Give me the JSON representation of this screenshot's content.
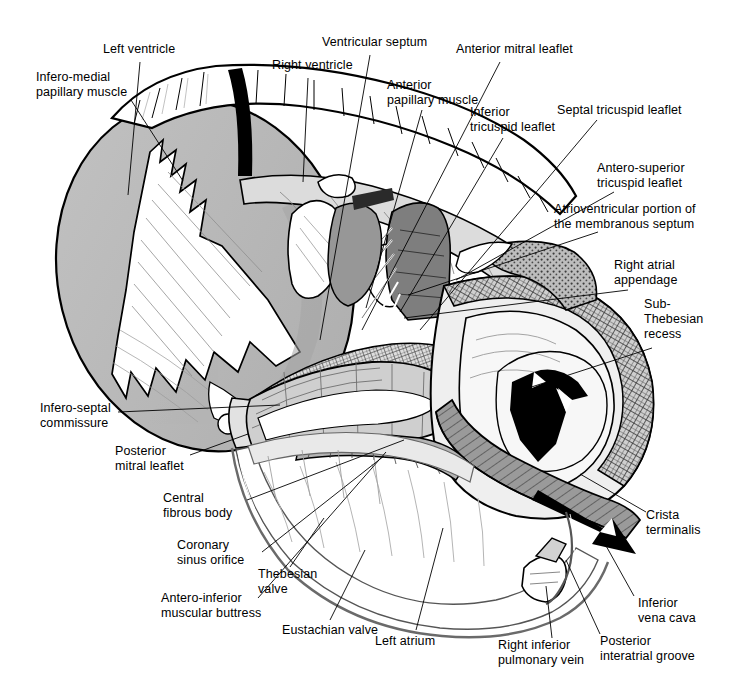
{
  "figure": {
    "width": 731,
    "height": 698,
    "background": "#ffffff",
    "line_color": "#000000",
    "fills": {
      "light_gray": "#d9d9d9",
      "mid_gray": "#b8b8b8",
      "dark_gray": "#8c8c8c",
      "darker_gray": "#6e6e6e",
      "black": "#000000",
      "white": "#ffffff"
    }
  },
  "labels": [
    {
      "id": "left-ventricle",
      "text": "Left ventricle",
      "x": 103,
      "y": 42,
      "align": "left",
      "leader": [
        [
          140,
          62
        ],
        [
          128,
          195
        ]
      ]
    },
    {
      "id": "infero-medial-papillary-muscle",
      "text": "Infero-medial\npapillary muscle",
      "x": 36,
      "y": 70,
      "align": "left",
      "leader": [
        [
          131,
          100
        ],
        [
          183,
          181
        ]
      ]
    },
    {
      "id": "right-ventricle",
      "text": "Right ventricle",
      "x": 272,
      "y": 58,
      "align": "left",
      "leader": [
        [
          308,
          78
        ],
        [
          303,
          182
        ]
      ]
    },
    {
      "id": "ventricular-septum",
      "text": "Ventricular septum",
      "x": 322,
      "y": 35,
      "align": "left",
      "leader": [
        [
          370,
          55
        ],
        [
          320,
          340
        ]
      ]
    },
    {
      "id": "anterior-papillary-muscle",
      "text": "Anterior\npapillary muscle",
      "x": 387,
      "y": 78,
      "align": "left",
      "leader": [
        [
          422,
          110
        ],
        [
          366,
          308
        ]
      ]
    },
    {
      "id": "anterior-mitral-leaflet",
      "text": "Anterior mitral leaflet",
      "x": 456,
      "y": 42,
      "align": "left",
      "leader": [
        [
          500,
          62
        ],
        [
          362,
          330
        ]
      ]
    },
    {
      "id": "inferior-tricuspid-leaflet",
      "text": "Inferior\ntricuspid leaflet",
      "x": 470,
      "y": 105,
      "align": "left",
      "leader": [
        [
          503,
          138
        ],
        [
          400,
          312
        ]
      ]
    },
    {
      "id": "septal-tricuspid-leaflet",
      "text": "Septal tricuspid leaflet",
      "x": 557,
      "y": 103,
      "align": "left",
      "leader": [
        [
          597,
          120
        ],
        [
          420,
          330
        ]
      ]
    },
    {
      "id": "antero-superior-tricuspid-leaflet",
      "text": "Antero-superior\ntricuspid leaflet",
      "x": 597,
      "y": 161,
      "align": "left",
      "leader": [
        [
          614,
          192
        ],
        [
          456,
          280
        ]
      ]
    },
    {
      "id": "atrioventricular-portion-membranous-septum",
      "text": "Atrioventricular portion of\nthe membranous septum",
      "x": 554,
      "y": 202,
      "align": "left",
      "leader": [
        [
          598,
          232
        ],
        [
          408,
          295
        ]
      ]
    },
    {
      "id": "right-atrial-appendage",
      "text": "Right atrial\nappendage",
      "x": 614,
      "y": 258,
      "align": "left",
      "leader": [
        [
          628,
          290
        ],
        [
          404,
          318
        ]
      ]
    },
    {
      "id": "sub-thebesian-recess",
      "text": "Sub-\nThebesian\nrecess",
      "x": 644,
      "y": 297,
      "align": "left",
      "leader": [
        [
          652,
          348
        ],
        [
          516,
          392
        ]
      ]
    },
    {
      "id": "crista-terminalis",
      "text": "Crista\nterminalis",
      "x": 646,
      "y": 508,
      "align": "left",
      "leader": [
        [
          646,
          512
        ],
        [
          580,
          474
        ]
      ]
    },
    {
      "id": "inferior-vena-cava",
      "text": "Inferior\nvena cava",
      "x": 638,
      "y": 596,
      "align": "left",
      "leader": [
        [
          634,
          596
        ],
        [
          600,
          535
        ]
      ]
    },
    {
      "id": "posterior-interatrial-groove",
      "text": "Posterior\ninteratrial groove",
      "x": 600,
      "y": 634,
      "align": "left",
      "leader": [
        [
          600,
          634
        ],
        [
          566,
          560
        ]
      ]
    },
    {
      "id": "right-inferior-pulmonary-vein",
      "text": "Right inferior\npulmonary vein",
      "x": 498,
      "y": 638,
      "align": "left",
      "leader": [
        [
          552,
          638
        ],
        [
          546,
          586
        ]
      ]
    },
    {
      "id": "left-atrium",
      "text": "Left atrium",
      "x": 375,
      "y": 634,
      "align": "left",
      "leader": [
        [
          416,
          630
        ],
        [
          443,
          528
        ]
      ]
    },
    {
      "id": "eustachian-valve",
      "text": "Eustachian valve",
      "x": 282,
      "y": 623,
      "align": "left",
      "leader": [
        [
          330,
          620
        ],
        [
          365,
          550
        ]
      ]
    },
    {
      "id": "thebesian-valve",
      "text": "Thebesian\nvalve",
      "x": 258,
      "y": 567,
      "align": "left",
      "leader": [
        [
          290,
          567
        ],
        [
          324,
          518
        ]
      ]
    },
    {
      "id": "antero-inferior-muscular-buttress",
      "text": "Antero-inferior\nmuscular buttress",
      "x": 161,
      "y": 591,
      "align": "left",
      "leader": [
        [
          258,
          598
        ],
        [
          386,
          452
        ]
      ]
    },
    {
      "id": "coronary-sinus-orifice",
      "text": "Coronary\nsinus orifice",
      "x": 177,
      "y": 538,
      "align": "left",
      "leader": [
        [
          262,
          552
        ],
        [
          384,
          456
        ]
      ]
    },
    {
      "id": "central-fibrous-body",
      "text": "Central\nfibrous body",
      "x": 163,
      "y": 491,
      "align": "left",
      "leader": [
        [
          247,
          500
        ],
        [
          404,
          440
        ]
      ]
    },
    {
      "id": "posterior-mitral-leaflet",
      "text": "Posterior\nmitral leaflet",
      "x": 115,
      "y": 444,
      "align": "left",
      "leader": [
        [
          190,
          455
        ],
        [
          248,
          434
        ]
      ]
    },
    {
      "id": "infero-septal-commissure",
      "text": "Infero-septal\ncommissure",
      "x": 40,
      "y": 401,
      "align": "left",
      "leader": [
        [
          118,
          412
        ],
        [
          280,
          405
        ]
      ]
    }
  ]
}
